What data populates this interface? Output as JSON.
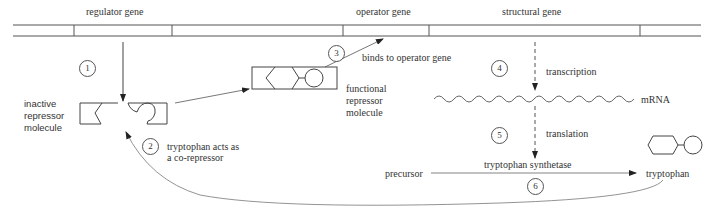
{
  "gene_bar": {
    "regulator_label": "regulator gene",
    "operator_label": "operator gene",
    "structural_label": "structural gene"
  },
  "steps": [
    {
      "number": "1",
      "label": ""
    },
    {
      "number": "2",
      "label": "tryptophan acts as a co-repressor",
      "line1": "tryptophan acts as",
      "line2": "a co-repressor"
    },
    {
      "number": "3",
      "label": "binds to operator gene"
    },
    {
      "number": "4",
      "label": "transcription"
    },
    {
      "number": "5",
      "label": "translation"
    },
    {
      "number": "6",
      "label": ""
    }
  ],
  "molecules": {
    "inactive_repressor": {
      "line1": "inactive",
      "line2": "repressor",
      "line3": "molecule"
    },
    "functional_repressor": {
      "line1": "functional",
      "line2": "repressor",
      "line3": "molecule"
    },
    "mrna": "mRNA",
    "precursor": "precursor",
    "enzyme": "tryptophan synthetase",
    "product": "tryptophan"
  },
  "colors": {
    "line": "#555555",
    "text": "#333333",
    "background": "#ffffff"
  }
}
